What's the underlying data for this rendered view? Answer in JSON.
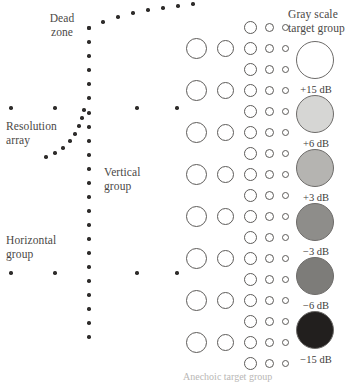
{
  "figure": {
    "background": "#ffffff",
    "width": 353,
    "height": 382
  },
  "labels": {
    "dead_zone": "Dead\nzone",
    "resolution_array": "Resolution\narray",
    "vertical_group": "Vertical\ngroup",
    "horizontal_group": "Horizontal\ngroup",
    "gray_scale_title": "Gray scale\ntarget group",
    "footer": "Anechoic target group"
  },
  "chart_data": {
    "type": "scatter",
    "xlabel": "",
    "ylabel": "",
    "xlim": [
      0,
      353
    ],
    "ylim": [
      0,
      382
    ],
    "grid": false,
    "legend": "none",
    "series": [
      {
        "name": "dead-zone-arc",
        "marker": "filled-dot",
        "points": [
          [
            89,
            28
          ],
          [
            103,
            22
          ],
          [
            118,
            17
          ],
          [
            133,
            13
          ],
          [
            148,
            10
          ],
          [
            163,
            8
          ],
          [
            178,
            6
          ],
          [
            193,
            4
          ]
        ]
      },
      {
        "name": "vertical-group",
        "marker": "filled-dot",
        "points": [
          [
            89,
            28
          ],
          [
            89,
            42
          ],
          [
            89,
            56
          ],
          [
            89,
            70
          ],
          [
            89,
            84
          ],
          [
            89,
            98
          ],
          [
            89,
            113
          ],
          [
            89,
            127
          ],
          [
            89,
            141
          ],
          [
            89,
            155
          ],
          [
            89,
            169
          ],
          [
            89,
            183
          ],
          [
            89,
            197
          ],
          [
            89,
            211
          ],
          [
            89,
            225
          ],
          [
            89,
            239
          ],
          [
            89,
            253
          ],
          [
            89,
            267
          ],
          [
            89,
            281
          ],
          [
            89,
            295
          ],
          [
            89,
            309
          ],
          [
            89,
            323
          ],
          [
            89,
            337
          ]
        ]
      },
      {
        "name": "resolution-array",
        "marker": "filled-dot",
        "points": [
          [
            84,
            110
          ],
          [
            82,
            118
          ],
          [
            79,
            126
          ],
          [
            75,
            134
          ],
          [
            70,
            141
          ],
          [
            63,
            148
          ],
          [
            55,
            153
          ],
          [
            46,
            157
          ]
        ]
      },
      {
        "name": "horizontal-group-upper",
        "marker": "filled-dot",
        "points": [
          [
            11,
            108
          ],
          [
            55,
            108
          ],
          [
            137,
            108
          ],
          [
            177,
            108
          ]
        ]
      },
      {
        "name": "horizontal-group-lower",
        "marker": "filled-dot",
        "points": [
          [
            11,
            273
          ],
          [
            55,
            273
          ],
          [
            137,
            273
          ],
          [
            177,
            273
          ]
        ]
      }
    ],
    "anechoic_target_group": {
      "marker": "open-circle",
      "columns": [
        {
          "name": "col-1",
          "cx": 196,
          "diameter": 21
        },
        {
          "name": "col-2",
          "cx": 225,
          "diameter": 17
        },
        {
          "name": "col-3",
          "cx": 250,
          "diameter": 13
        },
        {
          "name": "col-4",
          "cx": 269,
          "diameter": 9
        },
        {
          "name": "col-5",
          "cx": 285,
          "diameter": 7
        }
      ],
      "rows_all_columns": [
        48,
        90,
        132,
        174,
        216,
        258,
        300,
        342
      ],
      "rows_small_columns_only": [
        27,
        69,
        111,
        153,
        195,
        237,
        279,
        321,
        363
      ]
    },
    "gray_scale_target_group": {
      "cx": 315,
      "diameter": 38,
      "targets": [
        {
          "label": "+15 dB",
          "cy": 60,
          "fill": "#ffffff",
          "label_y": 84
        },
        {
          "label": "+6 dB",
          "cy": 114,
          "fill": "#d6d6d4",
          "label_y": 138
        },
        {
          "label": "+3 dB",
          "cy": 168,
          "fill": "#b5b4b1",
          "label_y": 192
        },
        {
          "label": "-3 dB",
          "cy": 222,
          "fill": "#8e8d8a",
          "label_y": 246
        },
        {
          "label": "-6 dB",
          "cy": 276,
          "fill": "#7d7c79",
          "label_y": 300
        },
        {
          "label": "-15 dB",
          "cy": 330,
          "fill": "#221f1e",
          "label_y": 354
        }
      ]
    }
  },
  "colors": {
    "dot": "#2e2c2b",
    "ring_stroke": "#5d5b59",
    "text": "#4a4846",
    "background": "#ffffff"
  }
}
